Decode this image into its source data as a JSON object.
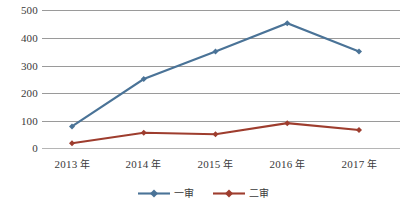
{
  "chart_data": {
    "type": "line",
    "title": "",
    "xlabel": "",
    "ylabel": "",
    "categories": [
      "2013 年",
      "2014 年",
      "2015 年",
      "2016 年",
      "2017 年"
    ],
    "ylim": [
      0,
      500
    ],
    "yticks": [
      0,
      100,
      200,
      300,
      400,
      500
    ],
    "grid": true,
    "legend_position": "bottom-center",
    "series": [
      {
        "name": "一审",
        "color": "#4A7397",
        "marker": "diamond",
        "values": [
          78,
          250,
          350,
          452,
          350
        ]
      },
      {
        "name": "二审",
        "color": "#9E3D2E",
        "marker": "diamond",
        "values": [
          17,
          55,
          50,
          90,
          65
        ]
      }
    ]
  },
  "axis": {
    "y_labels": [
      "500",
      "400",
      "300",
      "200",
      "100",
      "0"
    ],
    "x_labels": [
      {
        "year": "2013",
        "unit": "年"
      },
      {
        "year": "2014",
        "unit": "年"
      },
      {
        "year": "2015",
        "unit": "年"
      },
      {
        "year": "2016",
        "unit": "年"
      },
      {
        "year": "2017",
        "unit": "年"
      }
    ]
  },
  "legend": {
    "items": [
      {
        "label": "一审",
        "color": "#4A7397"
      },
      {
        "label": "二审",
        "color": "#9E3D2E"
      }
    ]
  }
}
